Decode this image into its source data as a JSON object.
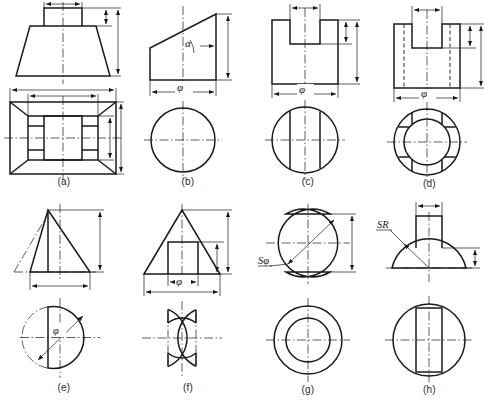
{
  "sheet": {
    "title": "Technical drawing plate - eight solid revolution / prism views",
    "background": "#ffffff",
    "line_color": "#1a1a1a",
    "width": 491,
    "height": 405
  },
  "figures": [
    {
      "id": "a",
      "caption": "(a)",
      "description": "Truncated rectangular pyramid (frustum) with rectangular boss on top; front view above, top view below",
      "labels": [],
      "views": [
        "front-view",
        "top-view"
      ]
    },
    {
      "id": "b",
      "caption": "(b)",
      "description": "Cylinder cut by an inclined plane; front view above, circular top view below",
      "labels": [
        "α",
        "φ"
      ],
      "views": [
        "front-view",
        "top-view"
      ]
    },
    {
      "id": "c",
      "caption": "(c)",
      "description": "Cylinder with a through slot cut in the top; front view above, circular top view with slot edges below",
      "labels": [
        "φ"
      ],
      "views": [
        "front-view",
        "top-view"
      ]
    },
    {
      "id": "d",
      "caption": "(d)",
      "description": "Hollow cylinder with slot; front view with hidden lines above, annular top view with four notches below",
      "labels": [
        "φ"
      ],
      "views": [
        "front-view",
        "top-view"
      ]
    },
    {
      "id": "e",
      "caption": "(e)",
      "description": "Cone cut by a vertical plane; front view above, circular top view with chord and inclined diameter below",
      "labels": [
        "φ"
      ],
      "views": [
        "front-view",
        "top-view"
      ]
    },
    {
      "id": "f",
      "caption": "(f)",
      "description": "Cone with rectangular slot; front view above, top view showing two opposed notches below",
      "labels": [
        "φ"
      ],
      "views": [
        "front-view",
        "top-view"
      ]
    },
    {
      "id": "g",
      "caption": "(g)",
      "description": "Sphere truncated top and bottom; front view above, concentric-circle top view below",
      "labels": [
        "Sφ"
      ],
      "views": [
        "front-view",
        "top-view"
      ]
    },
    {
      "id": "h",
      "caption": "(h)",
      "description": "Hemisphere with rectangular boss; front view above, circular top view with rectangle below",
      "labels": [
        "SR"
      ],
      "views": [
        "front-view",
        "top-view"
      ]
    }
  ]
}
